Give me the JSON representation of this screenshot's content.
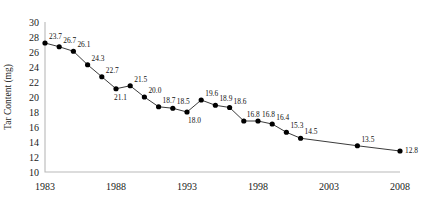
{
  "chart_data": {
    "type": "line",
    "title": "",
    "subtitle": "",
    "xlabel": "",
    "ylabel": "Tar Content (mg)",
    "xlim": [
      1983,
      2008
    ],
    "ylim": [
      10,
      30
    ],
    "grid": false,
    "legend": false,
    "legend_position": "none",
    "x_tick_labels": [
      "1983",
      "1988",
      "1993",
      "1998",
      "2003",
      "2008"
    ],
    "x_ticks": [
      1983,
      1988,
      1993,
      1998,
      2003,
      2008
    ],
    "y_tick_labels": [
      "10",
      "12",
      "14",
      "16",
      "18",
      "20",
      "22",
      "24",
      "26",
      "28",
      "30"
    ],
    "y_ticks": [
      10,
      12,
      14,
      16,
      18,
      20,
      22,
      24,
      26,
      28,
      30
    ],
    "marker": "filled-circle",
    "line_color": "#3b3b3b",
    "marker_color": "#000000",
    "axis_color": "#b9b9b9",
    "background_color": "#ffffff",
    "x": [
      1983,
      1984,
      1985,
      1986,
      1987,
      1988,
      1989,
      1990,
      1991,
      1992,
      1993,
      1994,
      1995,
      1996,
      1997,
      1998,
      1999,
      2000,
      2001,
      2005,
      2008
    ],
    "values": [
      27.2,
      26.7,
      26.1,
      24.3,
      22.7,
      21.1,
      21.5,
      20.0,
      18.7,
      18.5,
      18.0,
      19.6,
      18.9,
      18.6,
      16.8,
      16.8,
      16.4,
      15.3,
      14.5,
      13.5,
      12.8
    ],
    "point_labels": [
      "23.7",
      "26.7",
      "26.1",
      "24.3",
      "22.7",
      "21.1",
      "21.5",
      "20.0",
      "18.7",
      "18.5",
      "18.0",
      "19.6",
      "18.9",
      "18.6",
      "16.8",
      "16.8",
      "16.4",
      "15.3",
      "14.5",
      "13.5",
      "12.8"
    ],
    "label_offsets": [
      [
        4,
        -4
      ],
      [
        4,
        -4
      ],
      [
        4,
        -4
      ],
      [
        4,
        -4
      ],
      [
        4,
        -4
      ],
      [
        -2,
        11
      ],
      [
        4,
        -4
      ],
      [
        4,
        -4
      ],
      [
        4,
        -4
      ],
      [
        4,
        -4
      ],
      [
        1,
        11
      ],
      [
        4,
        -4
      ],
      [
        4,
        -4
      ],
      [
        4,
        -4
      ],
      [
        3,
        -4
      ],
      [
        4,
        -4
      ],
      [
        4,
        -4
      ],
      [
        4,
        -4
      ],
      [
        4,
        -4
      ],
      [
        4,
        -4
      ],
      [
        5,
        2
      ]
    ],
    "note": "First point is labeled 23.7 but plotted at approximately 27.2 in the source figure."
  }
}
